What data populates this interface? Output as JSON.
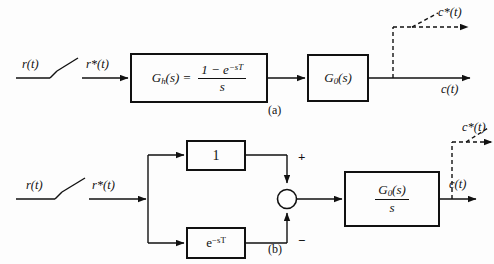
{
  "figure": {
    "type": "control-system-block-diagram",
    "background_color": "#fdfdfd",
    "line_color": "#111111",
    "panels": [
      {
        "caption": "(a)",
        "description": "Zero-order hold representation of a sampled-data system",
        "signals": {
          "input": "r(t)",
          "sampled_input": "r*(t)",
          "output": "c(t)",
          "sampled_output": "c*(t)"
        },
        "blocks": [
          {
            "name": "zero-order-hold",
            "label_lhs": "G",
            "label_sub": "h",
            "label_lhs_tail": "(s) =",
            "numerator": "1 − e",
            "numerator_sup": "−sT",
            "denominator": "s"
          },
          {
            "name": "plant",
            "label_lhs": "G",
            "label_sub": "0",
            "label_lhs_tail": "(s)"
          }
        ]
      },
      {
        "caption": "(b)",
        "description": "Equivalent representation using unity and delay paths with a summing junction",
        "signals": {
          "input": "r(t)",
          "sampled_input": "r*(t)",
          "output": "c(t)",
          "sampled_output": "c*(t)"
        },
        "summing_junction": {
          "name": "summing-junction",
          "top_sign": "+",
          "bottom_sign": "−"
        },
        "blocks": [
          {
            "name": "unity-gain",
            "label": "1"
          },
          {
            "name": "transport-delay",
            "label_base": "e",
            "label_sup": "−sT"
          },
          {
            "name": "plant-integrator",
            "numerator_lhs": "G",
            "numerator_sub": "0",
            "numerator_tail": "(s)",
            "denominator": "s"
          }
        ]
      }
    ]
  }
}
